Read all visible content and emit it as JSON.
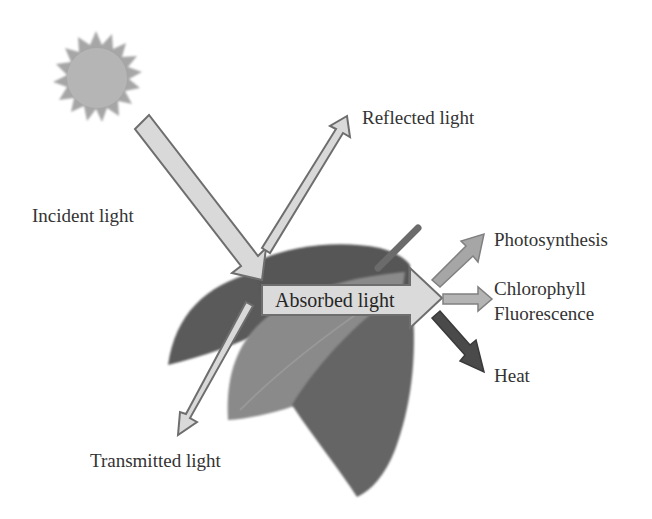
{
  "diagram": {
    "labels": {
      "incident": "Incident light",
      "reflected": "Reflected light",
      "absorbed": "Absorbed light",
      "transmitted": "Transmitted light",
      "photosynthesis": "Photosynthesis",
      "chlorophyll": "Chlorophyll",
      "fluorescence": "Fluorescence",
      "heat": "Heat"
    },
    "icons": {
      "sun": "sun-icon",
      "leaf": "leaf-cluster"
    },
    "colors": {
      "arrow_fill": "#d9d9d9",
      "arrow_stroke": "#6e6e6e",
      "sun_fill": "#a8a8a8",
      "leaf_dark": "#5e5e5e",
      "leaf_mid": "#7a7a7a",
      "leaf_light": "#8c8c8c",
      "photosynthesis_arrow": "#a0a0a0",
      "heat_arrow": "#4a4a4a",
      "text": "#333333"
    }
  }
}
